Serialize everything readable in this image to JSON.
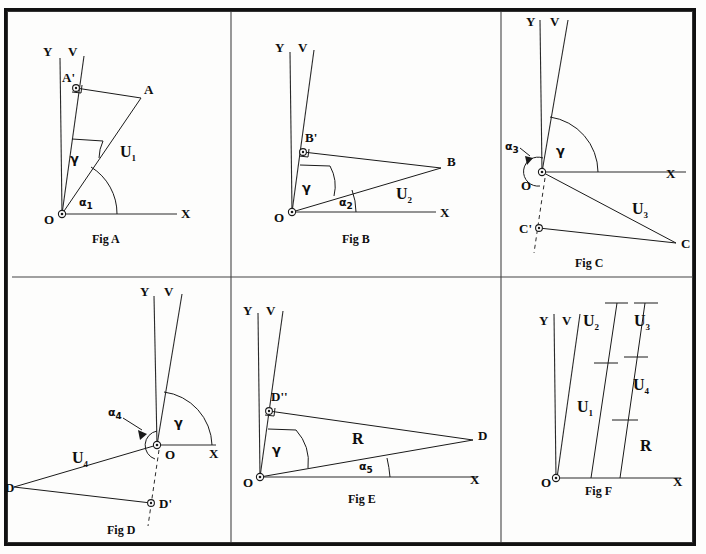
{
  "document": {
    "type": "technical-geometry-diagram",
    "panel_count": 6,
    "background_color": "#fdfdfc",
    "ink_color": "#1a1a1a"
  },
  "panels": [
    {
      "id": "fig-a",
      "caption": "Fig A",
      "axes": {
        "vertical": "Y",
        "oblique": "V",
        "horizontal": "X",
        "origin": "O"
      },
      "points": [
        {
          "name": "A",
          "label": "A"
        },
        {
          "name": "A-prime",
          "label": "A'"
        }
      ],
      "vector_label": "U",
      "vector_sub": "1",
      "angles": [
        {
          "name": "gamma",
          "label": "γ"
        },
        {
          "name": "alpha1",
          "label": "α",
          "sub": "1"
        }
      ]
    },
    {
      "id": "fig-b",
      "caption": "Fig B",
      "axes": {
        "vertical": "Y",
        "oblique": "V",
        "horizontal": "X",
        "origin": "O"
      },
      "points": [
        {
          "name": "B",
          "label": "B"
        },
        {
          "name": "B-prime",
          "label": "B'"
        }
      ],
      "vector_label": "U",
      "vector_sub": "2",
      "angles": [
        {
          "name": "gamma",
          "label": "γ"
        },
        {
          "name": "alpha2",
          "label": "α",
          "sub": "2"
        }
      ]
    },
    {
      "id": "fig-c",
      "caption": "Fig C",
      "axes": {
        "vertical": "Y",
        "oblique": "V",
        "horizontal": "X",
        "origin": "O"
      },
      "points": [
        {
          "name": "C",
          "label": "C"
        },
        {
          "name": "C-prime",
          "label": "C'"
        }
      ],
      "vector_label": "U",
      "vector_sub": "3",
      "angles": [
        {
          "name": "gamma",
          "label": "γ"
        },
        {
          "name": "alpha3",
          "label": "α",
          "sub": "3"
        }
      ]
    },
    {
      "id": "fig-d",
      "caption": "Fig D",
      "axes": {
        "vertical": "Y",
        "oblique": "V",
        "horizontal": "X",
        "origin": "O"
      },
      "points": [
        {
          "name": "D",
          "label": "D"
        },
        {
          "name": "D-prime",
          "label": "D'"
        }
      ],
      "vector_label": "U",
      "vector_sub": "4",
      "angles": [
        {
          "name": "gamma",
          "label": "γ"
        },
        {
          "name": "alpha4",
          "label": "α",
          "sub": "4"
        }
      ]
    },
    {
      "id": "fig-e",
      "caption": "Fig E",
      "axes": {
        "vertical": "Y",
        "oblique": "V",
        "horizontal": "X",
        "origin": "O"
      },
      "points": [
        {
          "name": "D",
          "label": "D"
        },
        {
          "name": "D-double-prime",
          "label": "D''"
        }
      ],
      "vector_label": "R",
      "vector_sub": "",
      "angles": [
        {
          "name": "gamma",
          "label": "γ"
        },
        {
          "name": "alpha5",
          "label": "α",
          "sub": "5"
        }
      ]
    },
    {
      "id": "fig-f",
      "caption": "Fig F",
      "axes": {
        "vertical": "Y",
        "oblique": "V",
        "horizontal": "X",
        "origin": "O"
      },
      "stacked_labels": [
        {
          "name": "u1",
          "label": "U",
          "sub": "1"
        },
        {
          "name": "u2",
          "label": "U",
          "sub": "2"
        },
        {
          "name": "u3",
          "label": "U",
          "sub": "3"
        },
        {
          "name": "u4",
          "label": "U",
          "sub": "4"
        },
        {
          "name": "r",
          "label": "R",
          "sub": ""
        }
      ]
    }
  ]
}
